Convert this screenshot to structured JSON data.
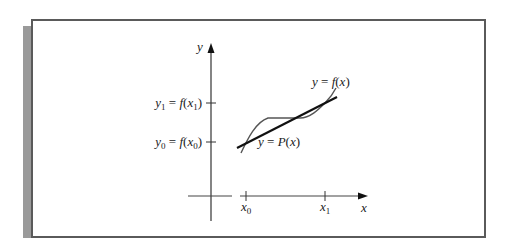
{
  "figure": {
    "axis_labels": {
      "y": "y",
      "x": "x"
    },
    "y_ticks": [
      {
        "var": "y",
        "sub": "1",
        "eq": " = ",
        "fn": "f",
        "arg": "x",
        "argsub": "1"
      },
      {
        "var": "y",
        "sub": "0",
        "eq": " = ",
        "fn": "f",
        "arg": "x",
        "argsub": "0"
      }
    ],
    "x_ticks": [
      {
        "var": "x",
        "sub": "0"
      },
      {
        "var": "x",
        "sub": "1"
      }
    ],
    "curves": [
      {
        "name": "f",
        "label_pre": "y = ",
        "label_fn": "f",
        "label_post": "(x)"
      },
      {
        "name": "P",
        "label_pre": "y = ",
        "label_fn": "P",
        "label_post": "(x)"
      }
    ],
    "colors": {
      "frame": "#5a5a5a",
      "shadow": "#9a9a9a",
      "ink": "#222222"
    }
  }
}
